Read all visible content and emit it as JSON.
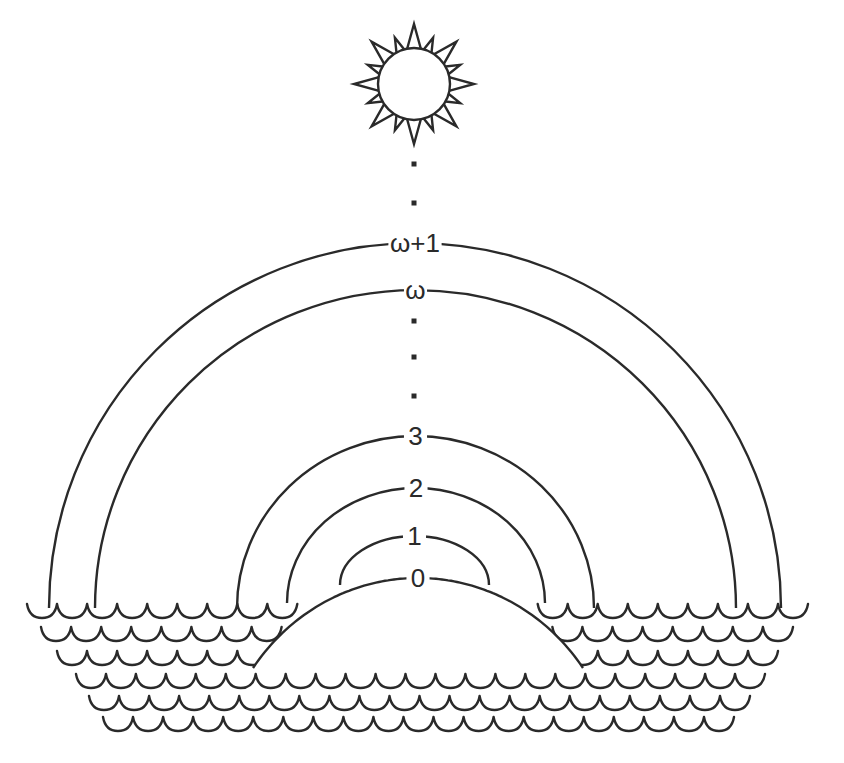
{
  "diagram": {
    "stroke_color": "#2a2a2a",
    "background": "#ffffff",
    "sun": {
      "cx": 414,
      "cy": 84,
      "r": 36,
      "rays": 16,
      "icon": "sun-icon"
    },
    "dots_above": [
      {
        "x": 414,
        "y": 164
      },
      {
        "x": 414,
        "y": 203
      }
    ],
    "dots_middle": [
      {
        "x": 414,
        "y": 321
      },
      {
        "x": 414,
        "y": 357
      },
      {
        "x": 414,
        "y": 396
      }
    ],
    "arcs": [
      {
        "label": "ω+1",
        "top_y": 243,
        "left_x": 49,
        "right_x": 781,
        "end_y": 608
      },
      {
        "label": "ω",
        "top_y": 290,
        "left_x": 95,
        "right_x": 736,
        "end_y": 608
      },
      {
        "label": "3",
        "top_y": 436,
        "left_x": 237,
        "right_x": 594,
        "end_y": 608
      },
      {
        "label": "2",
        "top_y": 488,
        "left_x": 287,
        "right_x": 545,
        "end_y": 603
      },
      {
        "label": "1",
        "top_y": 536,
        "left_x": 340,
        "right_x": 489,
        "end_y": 585
      }
    ],
    "island": {
      "label": "0",
      "top_y": 578,
      "left_x": 253,
      "right_x": 583,
      "base_y": 668
    },
    "waves": {
      "scallop_width": 29.5,
      "scallop_depth": 12,
      "rows": [
        {
          "y": 606,
          "x_start": 27,
          "x_end": 808
        },
        {
          "y": 629,
          "x_start": 41,
          "x_end": 793
        },
        {
          "y": 653,
          "x_start": 57,
          "x_end": 778
        },
        {
          "y": 676,
          "x_start": 76,
          "x_end": 765
        },
        {
          "y": 698,
          "x_start": 89,
          "x_end": 750
        },
        {
          "y": 719,
          "x_start": 103,
          "x_end": 734
        }
      ]
    }
  }
}
